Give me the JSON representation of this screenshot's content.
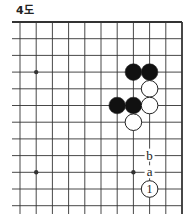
{
  "title": "4도",
  "board": {
    "cols_x": [
      20,
      36.2,
      52.4,
      68.6,
      84.8,
      101,
      117.2,
      133.4,
      149.6,
      165.8,
      182
    ],
    "rows_y": [
      22,
      38.7,
      55.4,
      72.1,
      88.8,
      105.5,
      122.2,
      138.9,
      155.6,
      172.3,
      189,
      205.7
    ],
    "edges": {
      "top": true,
      "right": true,
      "left": false,
      "bottom": false
    },
    "star_points": [
      [
        1,
        3
      ],
      [
        1,
        9
      ],
      [
        7,
        9
      ]
    ],
    "stones": [
      {
        "col": 7,
        "row": 3,
        "color": "black"
      },
      {
        "col": 8,
        "row": 3,
        "color": "black"
      },
      {
        "col": 8,
        "row": 4,
        "color": "white"
      },
      {
        "col": 6,
        "row": 5,
        "color": "black"
      },
      {
        "col": 7,
        "row": 5,
        "color": "black"
      },
      {
        "col": 8,
        "row": 5,
        "color": "white"
      },
      {
        "col": 7,
        "row": 6,
        "color": "white"
      },
      {
        "col": 8,
        "row": 10,
        "color": "white",
        "number": "1"
      }
    ],
    "labels": [
      {
        "col": 8,
        "row": 8,
        "text": "b"
      },
      {
        "col": 8,
        "row": 9,
        "text": "a"
      }
    ],
    "colors": {
      "line": "#333333",
      "black_stone": "#111111",
      "white_stone": "#ffffff",
      "stone_outline": "#222222"
    }
  }
}
